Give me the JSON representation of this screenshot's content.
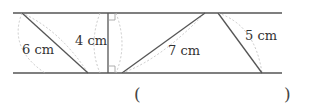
{
  "diagram": {
    "type": "parallel-lines-segments",
    "colors": {
      "line": "#555555",
      "guide": "#bbbbbb",
      "text": "#333333"
    },
    "labels": [
      {
        "id": "seg1",
        "text": "6 cm"
      },
      {
        "id": "seg2",
        "text": "4 cm"
      },
      {
        "id": "seg3",
        "text": "7 cm"
      },
      {
        "id": "seg4",
        "text": "5 cm"
      }
    ],
    "answer": {
      "open": "(",
      "close": ")",
      "value": ""
    }
  }
}
